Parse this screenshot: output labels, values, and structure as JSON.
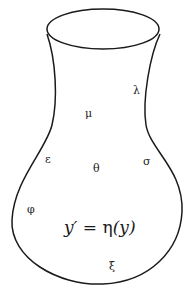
{
  "figure": {
    "width": 193,
    "height": 298,
    "stroke_color": "#1a1a1a",
    "background": "#ffffff",
    "rim": {
      "cx": 103,
      "cy": 29,
      "rx": 56,
      "ry": 20
    },
    "outline_path": "M 47 34 C 56 60, 58 100, 52 125 C 46 150, 14 180, 12 220 C 10 258, 58 286, 103 284 C 150 282, 180 250, 182 212 C 184 170, 150 150, 146 125 C 142 100, 150 55, 160 34"
  },
  "labels": {
    "lambda": {
      "text": "λ",
      "x": 133,
      "y": 94
    },
    "mu": {
      "text": "μ",
      "x": 85,
      "y": 117
    },
    "epsilon": {
      "text": "ε",
      "x": 45,
      "y": 163
    },
    "theta": {
      "text": "θ",
      "x": 93,
      "y": 172
    },
    "sigma": {
      "text": "σ",
      "x": 143,
      "y": 165
    },
    "phi": {
      "text": "φ",
      "x": 27,
      "y": 213
    },
    "xi": {
      "text": "ξ",
      "x": 109,
      "y": 270
    }
  },
  "equation": {
    "lhs": "y′",
    "eq": " = ",
    "fn": "η",
    "arg": "(y)",
    "x": 64,
    "y": 233
  }
}
